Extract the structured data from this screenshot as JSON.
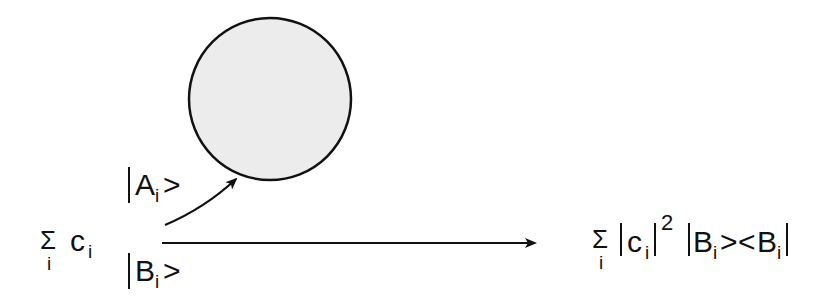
{
  "diagram": {
    "circle": {
      "cx": 270,
      "cy": 99,
      "r": 81,
      "fill": "#ececec",
      "stroke": "#111111"
    },
    "left_expr": {
      "sigma": "Σ",
      "sigma_sub": "i",
      "coef": "c",
      "coef_sub": "i"
    },
    "ket_a": {
      "open": "",
      "letter": "A",
      "sub": "i",
      "close": ">"
    },
    "ket_b": {
      "open": "",
      "letter": "B",
      "sub": "i",
      "close": ">"
    },
    "right_expr": {
      "sigma": "Σ",
      "sigma_sub": "i",
      "coef": "c",
      "coef_sub": "i",
      "power": "2",
      "ket_letter": "B",
      "ket_sub": "i",
      "ket_close": ">",
      "bra_open": "<",
      "bra_letter": "B",
      "bra_sub": "i"
    },
    "arrows": [
      {
        "name": "curved-arrow-to-circle",
        "from": [
          165,
          225
        ],
        "to": [
          237,
          178
        ]
      },
      {
        "name": "horizontal-arrow",
        "from": [
          162,
          243
        ],
        "to": [
          535,
          243
        ]
      }
    ]
  }
}
